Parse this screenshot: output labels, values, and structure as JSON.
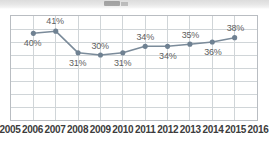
{
  "chart_data": {
    "type": "line",
    "title": "",
    "xlabel": "",
    "ylabel": "",
    "grid": true,
    "legend": false,
    "x_tick_labels": [
      "2005",
      "2006",
      "2007",
      "2008",
      "2009",
      "2010",
      "2011",
      "2012",
      "2013",
      "2014",
      "2015",
      "2016"
    ],
    "xlim": [
      "2005",
      "2016"
    ],
    "ylim": [
      0,
      48
    ],
    "y_gridline_count": 8,
    "categories": [
      "2006",
      "2007",
      "2008",
      "2009",
      "2010",
      "2011",
      "2012",
      "2013",
      "2014",
      "2015"
    ],
    "values": [
      40,
      41,
      31,
      30,
      31,
      34,
      34,
      35,
      36,
      38
    ],
    "point_labels": [
      "40%",
      "41%",
      "31%",
      "30%",
      "31%",
      "34%",
      "34%",
      "35%",
      "36%",
      "38%"
    ],
    "label_positions": [
      "below",
      "above",
      "below",
      "above",
      "below",
      "above",
      "below",
      "above",
      "below",
      "above"
    ],
    "series": [
      {
        "name": "",
        "values": [
          40,
          41,
          31,
          30,
          31,
          34,
          34,
          35,
          36,
          38
        ],
        "color": "#7b8b9a",
        "marker": "circle"
      }
    ],
    "colors": {
      "line": "#7b8b9a",
      "marker": "#6f8192",
      "grid": "#cfd4d8",
      "plot_border": "#b9bdc2",
      "data_label_text": "#5e5e5e",
      "axis_label_text": "#3c3c3c",
      "background": "#ffffff"
    }
  }
}
